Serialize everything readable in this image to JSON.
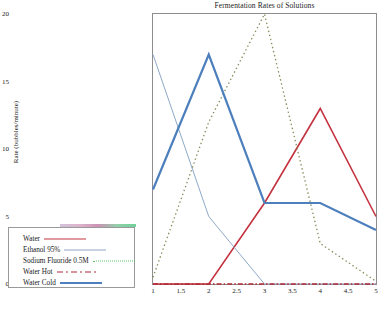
{
  "chart_data": {
    "type": "line",
    "title": "Fermentation Rates of Solutions",
    "xlabel": "",
    "ylabel": "Rate (bubbles/minute)",
    "x": [
      1,
      2,
      3,
      4,
      5
    ],
    "xlim": [
      1,
      5
    ],
    "ylim": [
      0,
      20
    ],
    "xticks": [
      "1",
      "1.5",
      "2",
      "2.5",
      "3",
      "3.5",
      "4",
      "4.5",
      "5"
    ],
    "xtick_values": [
      1,
      1.5,
      2,
      2.5,
      3,
      3.5,
      4,
      4.5,
      5
    ],
    "yticks": [
      "0",
      "5",
      "10",
      "15",
      "20"
    ],
    "ytick_values": [
      0,
      5,
      10,
      15,
      20
    ],
    "grid": false,
    "legend_position": "outside-left-bottom",
    "series": [
      {
        "name": "Water",
        "values": [
          0,
          0,
          6,
          13,
          5
        ],
        "color": "#c4333f",
        "style": "solid",
        "width": 1.6
      },
      {
        "name": "Ethanol 95%",
        "values": [
          17,
          5,
          0,
          0,
          0
        ],
        "color": "#8fa8c8",
        "style": "solid",
        "width": 1.0
      },
      {
        "name": "Sodium Fluoride 0.5M",
        "values": [
          0.5,
          12,
          20,
          3,
          0.2
        ],
        "color": "#7f8f5a",
        "style": "dotted",
        "width": 1.3
      },
      {
        "name": "Water Hot",
        "values": [
          0,
          0,
          0,
          0,
          0
        ],
        "color": "#b02a36",
        "style": "dashdot",
        "width": 1.4
      },
      {
        "name": "Water Cold",
        "values": [
          7,
          17,
          6,
          6,
          4
        ],
        "color": "#4d7fbd",
        "style": "solid",
        "width": 2.2
      }
    ]
  },
  "legend": {
    "items": [
      {
        "label": "Water",
        "sample": "ls-solid-red"
      },
      {
        "label": "Ethanol 95%",
        "sample": "ls-thin-blue"
      },
      {
        "label": "Sodium Fluoride 0.5M",
        "sample": "ls-dot-green"
      },
      {
        "label": "Water Hot",
        "sample": "ls-dashdot-red"
      },
      {
        "label": "Water Cold",
        "sample": "ls-thick-blue"
      }
    ]
  }
}
